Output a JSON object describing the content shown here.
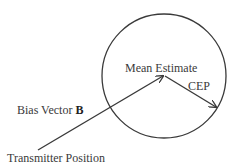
{
  "diagram": {
    "labels": {
      "mean_estimate": "Mean Estimate",
      "cep": "CEP",
      "bias_vector": "Bias Vector ",
      "bias_vector_symbol": "B",
      "transmitter_position": "Transmitter Position"
    },
    "colors": {
      "stroke": "#3a3a3a",
      "text": "#3a3a3a",
      "background": "#ffffff"
    },
    "geometry": {
      "circle": {
        "cx": 164,
        "cy": 76,
        "r": 62
      },
      "transmitter_point": {
        "x": 38,
        "y": 150
      },
      "mean_estimate_point": {
        "x": 164,
        "y": 76
      },
      "cep_endpoint": {
        "x": 217,
        "y": 108
      }
    }
  }
}
